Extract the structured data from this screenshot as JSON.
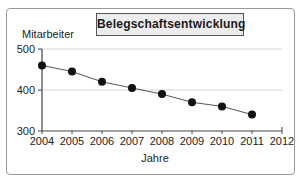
{
  "chart_data": {
    "type": "line",
    "title": "Belegschaftsentwicklung",
    "xlabel": "Jahre",
    "ylabel": "Mitarbeiter",
    "x": [
      2004,
      2005,
      2006,
      2007,
      2008,
      2009,
      2010,
      2011
    ],
    "values": [
      460,
      445,
      420,
      405,
      390,
      370,
      360,
      340
    ],
    "x_ticks": [
      2004,
      2005,
      2006,
      2007,
      2008,
      2009,
      2010,
      2011,
      2012
    ],
    "y_ticks": [
      300,
      400,
      500
    ],
    "xlim": [
      2004,
      2012
    ],
    "ylim": [
      300,
      500
    ],
    "grid": "horizontal gridlines at 400 and 500",
    "legend": "none",
    "colors": {
      "marker": "#111111",
      "line": "#555555",
      "grid": "#d4d4d4",
      "axis": "#444444",
      "tick_label": "#222222",
      "title_box_bg": "#ececec",
      "title_box_border": "#555555",
      "frame_border": "#999999"
    }
  }
}
